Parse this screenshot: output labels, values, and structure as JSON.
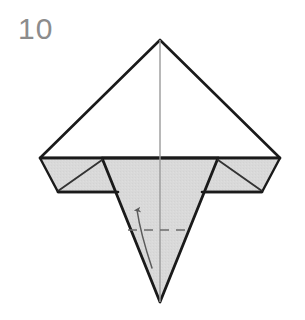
{
  "figure": {
    "kind": "origami-fold-diagram",
    "step_number": "10",
    "caption": "",
    "background_color": "#ffffff"
  },
  "colors": {
    "paper_front": "#ffffff",
    "paper_back": "#d9d9d9",
    "paper_back_shade": "#d2d2d2",
    "outline": "#1a1a1a",
    "crease_line": "#555555",
    "center_line": "#9a9a9a",
    "fold_dash": "#6b6b6b",
    "arrow": "#5a5a5a",
    "step_number_color": "#8c8c8c"
  },
  "geometry": {
    "apex_top": {
      "x": 160,
      "y": 40
    },
    "left_point": {
      "x": 40,
      "y": 158
    },
    "right_point": {
      "x": 280,
      "y": 158
    },
    "left_wing_bottom": {
      "x": 58,
      "y": 192
    },
    "right_wing_bottom": {
      "x": 262,
      "y": 192
    },
    "left_inner_junction": {
      "x": 102,
      "y": 160
    },
    "right_inner_junction": {
      "x": 218,
      "y": 160
    },
    "left_v_shoulder": {
      "x": 118,
      "y": 192
    },
    "right_v_shoulder": {
      "x": 202,
      "y": 192
    },
    "bottom_point": {
      "x": 160,
      "y": 302
    },
    "center_axis_x": 160
  },
  "annotations": {
    "fold_line": {
      "name": "valley-fold-dashed-line",
      "style": "dashed",
      "y": 230,
      "x_start": 128,
      "x_end": 192
    },
    "arrow": {
      "name": "fold-up-arrow",
      "direction": "up",
      "tail": {
        "x": 152,
        "y": 268
      },
      "head": {
        "x": 137,
        "y": 204
      },
      "label": ""
    }
  },
  "labels": {
    "step": "10"
  }
}
